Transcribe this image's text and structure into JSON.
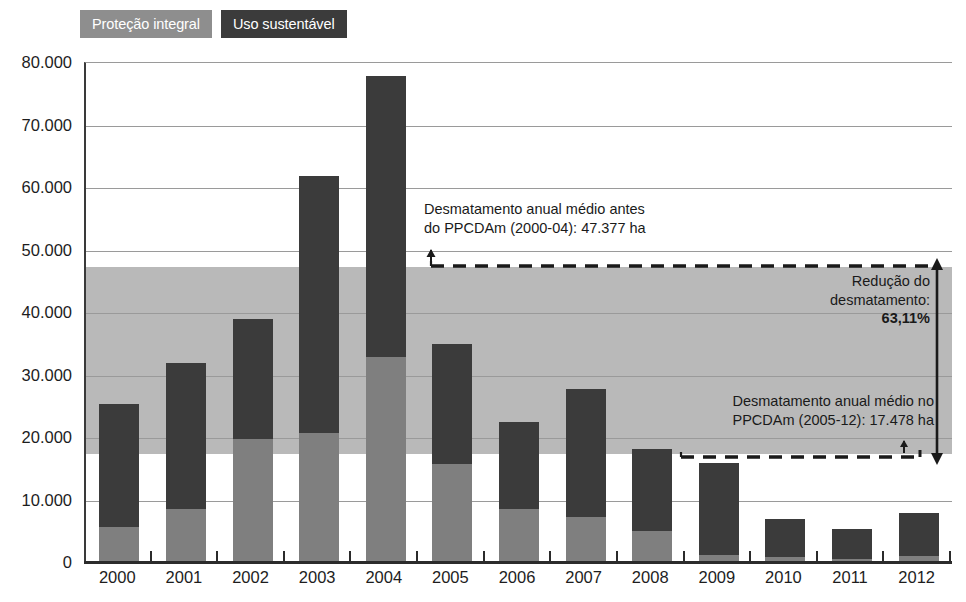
{
  "legend": {
    "items": [
      {
        "label": "Proteção integral",
        "color": "#8e8e8e",
        "key": "protecao"
      },
      {
        "label": "Uso sustentável",
        "color": "#3b3b3b",
        "key": "uso"
      }
    ]
  },
  "annotations": {
    "before": {
      "line1": "Desmatamento anual médio antes",
      "line2": "do PPCDAm (2000-04): 47.377 ha",
      "value": 47377
    },
    "after": {
      "line1": "Desmatamento anual médio no",
      "line2": "PPCDAm (2005-12): 17.478 ha",
      "value": 17478
    },
    "reduction": {
      "line1": "Redução do",
      "line2_prefix": "desmatamento: ",
      "line2_value": "63,11%"
    }
  },
  "chart_data": {
    "type": "bar",
    "stacked": true,
    "title": "",
    "xlabel": "",
    "ylabel": "",
    "ylim": [
      0,
      80000
    ],
    "ytick_labels": [
      "0",
      "10.000",
      "20.000",
      "30.000",
      "40.000",
      "50.000",
      "60.000",
      "70.000",
      "80.000"
    ],
    "ytick_values": [
      0,
      10000,
      20000,
      30000,
      40000,
      50000,
      60000,
      70000,
      80000
    ],
    "grid": true,
    "legend_position": "top-left",
    "categories": [
      "2000",
      "2001",
      "2002",
      "2003",
      "2004",
      "2005",
      "2006",
      "2007",
      "2008",
      "2009",
      "2010",
      "2011",
      "2012"
    ],
    "series": [
      {
        "name": "Proteção integral",
        "color": "#7f7f7f",
        "values": [
          5800,
          8600,
          19800,
          20800,
          33000,
          15800,
          8700,
          7400,
          5200,
          1300,
          1000,
          600,
          1100
        ]
      },
      {
        "name": "Uso sustentável",
        "color": "#3b3b3b",
        "values": [
          19700,
          23400,
          19200,
          41200,
          45000,
          19200,
          13800,
          20400,
          13100,
          14700,
          6100,
          4900,
          6900
        ]
      }
    ],
    "totals": [
      25500,
      32000,
      39000,
      62000,
      78000,
      35000,
      22500,
      27800,
      18300,
      16000,
      7100,
      5500,
      8000
    ],
    "reference_bands": [
      {
        "name": "faixa de referência",
        "from": 17478,
        "to": 47377,
        "color": "#b9b9b9"
      }
    ],
    "reference_lines": [
      {
        "name": "média antes do PPCDAm",
        "value": 47377,
        "style": "dashed"
      },
      {
        "name": "média no PPCDAm",
        "value": 17478,
        "style": "dashed"
      }
    ]
  }
}
